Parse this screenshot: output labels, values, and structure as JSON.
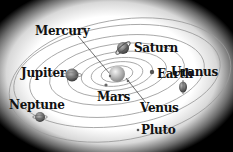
{
  "sun": {
    "name": "sun-icon"
  },
  "planets": [
    {
      "name": "Mercury",
      "label_x": 35,
      "label_y": 24
    },
    {
      "name": "Saturn",
      "label_x": 134,
      "label_y": 43
    },
    {
      "name": "Jupiter",
      "label_x": 21,
      "label_y": 67
    },
    {
      "name": "Earth",
      "label_x": 158,
      "label_y": 70
    },
    {
      "name": "Uranus",
      "label_x": 171,
      "label_y": 67
    },
    {
      "name": "Mars",
      "label_x": 98,
      "label_y": 92
    },
    {
      "name": "Neptune",
      "label_x": 10,
      "label_y": 100
    },
    {
      "name": "Venus",
      "label_x": 140,
      "label_y": 102
    },
    {
      "name": "Pluto",
      "label_x": 141,
      "label_y": 125
    }
  ],
  "colors": {
    "orbit": "#9a9a9a",
    "text": "#111111",
    "planet": "#777777",
    "background_edge": "#000000"
  }
}
